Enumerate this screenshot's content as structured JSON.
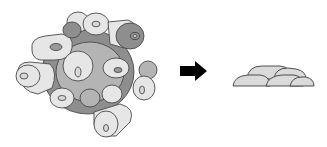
{
  "diagram": {
    "left_panel": {
      "label": "",
      "type": "cell-aggregate",
      "colors": {
        "light": "#e6e6e6",
        "mid": "#b4b4b4",
        "dark": "#8e8e8e",
        "outline": "#4a4a4a"
      }
    },
    "arrow": {
      "direction": "right",
      "color": "#000000"
    },
    "right_panel": {
      "label": "",
      "type": "flattened-cell-layer",
      "dome_count": 5,
      "colors": {
        "fill": "#dadada",
        "outline": "#3d3d3d"
      }
    }
  }
}
